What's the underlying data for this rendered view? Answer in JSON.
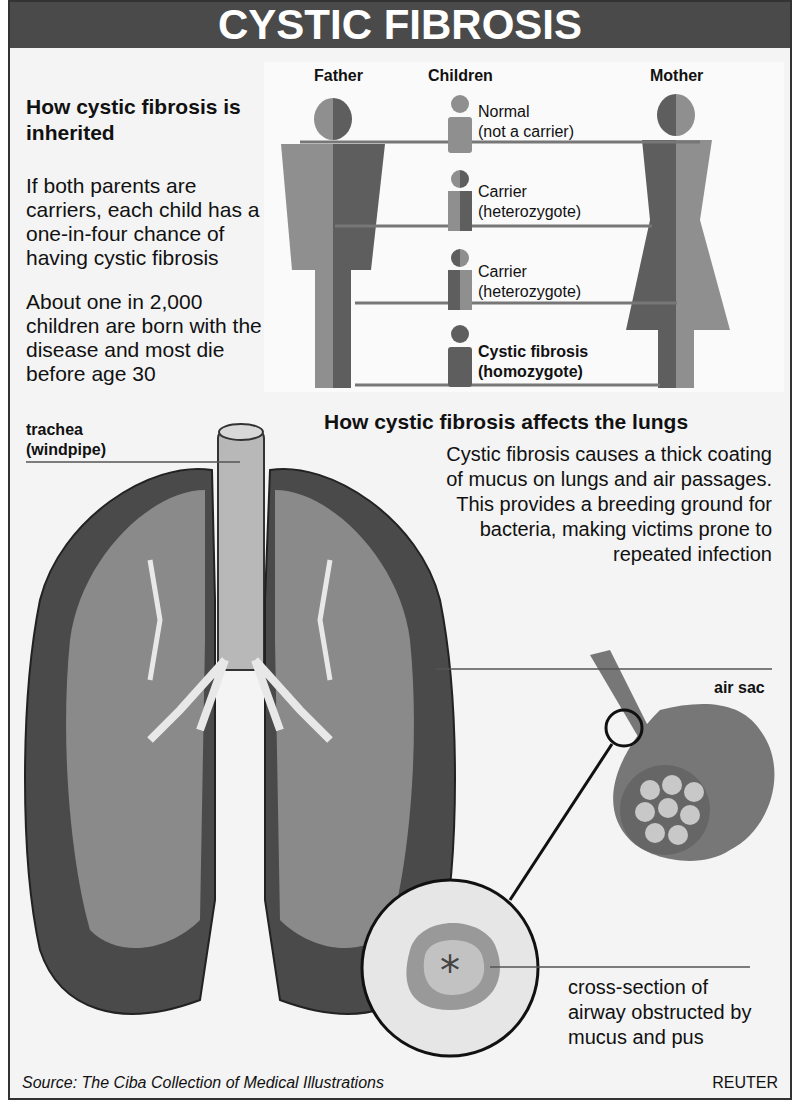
{
  "title": "CYSTIC FIBROSIS",
  "inheritance": {
    "heading": "How cystic fibrosis is inherited",
    "paragraph1": "If both parents are carriers, each child has a one-in-four chance of having cystic fibrosis",
    "paragraph2": "About one in 2,000 children are born with the disease and most die before age 30",
    "column_headers": {
      "father": "Father",
      "children": "Children",
      "mother": "Mother"
    },
    "children": [
      {
        "label": "Normal",
        "sublabel": "(not a carrier)",
        "bold": false
      },
      {
        "label": "Carrier",
        "sublabel": "(heterozygote)",
        "bold": false
      },
      {
        "label": "Carrier",
        "sublabel": "(heterozygote)",
        "bold": false
      },
      {
        "label": "Cystic fibrosis",
        "sublabel": "(homozygote)",
        "bold": true
      }
    ],
    "colors": {
      "light": "#8f8f8f",
      "dark": "#5e5e5e"
    }
  },
  "lungs": {
    "heading": "How cystic fibrosis affects the lungs",
    "description": "Cystic fibrosis causes a thick coating of mucus on lungs and air passages. This provides a breeding ground for bacteria, making victims prone to repeated infection",
    "labels": {
      "trachea": "trachea",
      "trachea_sub": "(windpipe)",
      "air_sac": "air sac",
      "cross_section": "cross-section of airway obstructed by mucus and pus"
    }
  },
  "footer": {
    "source": "Source: The Ciba Collection of Medical Illustrations",
    "credit": "REUTER"
  }
}
